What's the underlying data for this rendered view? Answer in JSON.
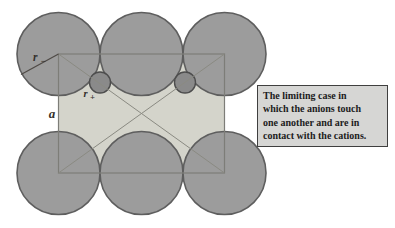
{
  "figure": {
    "kind": "ionic-packing-limiting-case-diagram",
    "labels": {
      "anion_radius": {
        "base": "r",
        "sub": "−"
      },
      "cation_radius": {
        "base": "r",
        "sub": "+"
      },
      "cell_edge": "a"
    },
    "colors": {
      "background": "#ffffff",
      "anion_fill": "#9c9c9c",
      "anion_stroke": "#5e5e5e",
      "cation_fill": "#8a8a8a",
      "cation_stroke": "#4d4d4d",
      "cell_fill": "#d4d4cb",
      "cell_stroke": "#7d7d78",
      "diagonal_stroke": "#8a8a82",
      "radius_line": "#4f4a46",
      "label_color": "#332f2b"
    }
  },
  "callout": {
    "lines": [
      "The limiting case in",
      "which the anions touch",
      "one another and are in",
      "contact with the cations."
    ],
    "background": "#d6d6d4",
    "border": "#3f3f3f",
    "text_color": "#1c1c1c"
  }
}
